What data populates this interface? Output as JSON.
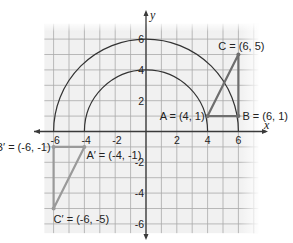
{
  "diagram": {
    "type": "coordinate-plane-rotation",
    "axes": {
      "x_label": "x",
      "y_label": "y",
      "x_ticks": [
        {
          "value": -6,
          "label": "-6"
        },
        {
          "value": -4,
          "label": "-4"
        },
        {
          "value": -2,
          "label": "-2"
        },
        {
          "value": 2,
          "label": "2"
        },
        {
          "value": 4,
          "label": "4"
        },
        {
          "value": 6,
          "label": "6"
        }
      ],
      "y_ticks": [
        {
          "value": 6,
          "label": "6"
        },
        {
          "value": 4,
          "label": "4"
        },
        {
          "value": 2,
          "label": "2"
        },
        {
          "value": -2,
          "label": "-2"
        },
        {
          "value": -4,
          "label": "-4"
        },
        {
          "value": -6,
          "label": "-6"
        }
      ]
    },
    "arcs": [
      {
        "radius": 4,
        "from_deg": 0,
        "to_deg": 180,
        "label": "arc-radius-4"
      },
      {
        "radius": 6,
        "from_deg": 0,
        "to_deg": 180,
        "label": "arc-radius-6"
      }
    ],
    "triangles": {
      "original": {
        "points": [
          {
            "name": "A",
            "x": 4,
            "y": 1,
            "label": "A = (4, 1)"
          },
          {
            "name": "B",
            "x": 6,
            "y": 1,
            "label": "B = (6, 1)"
          },
          {
            "name": "C",
            "x": 6,
            "y": 5,
            "label": "C = (6, 5)"
          }
        ]
      },
      "image": {
        "points": [
          {
            "name": "A'",
            "x": -4,
            "y": -1,
            "label": "A′ = (-4, -1)"
          },
          {
            "name": "B'",
            "x": -6,
            "y": -1,
            "label": "B′ = (-6, -1)"
          },
          {
            "name": "C'",
            "x": -6,
            "y": -5,
            "label": "C′ = (-6, -5)"
          }
        ]
      }
    },
    "colors": {
      "grid_bg": "#f1f1f1",
      "grid_line": "#a9a9a9",
      "axis": "#3a3a3a",
      "arc": "#333333",
      "original_triangle": "#6e6e6e",
      "image_triangle": "#9a9a9a",
      "text": "#222222"
    }
  }
}
